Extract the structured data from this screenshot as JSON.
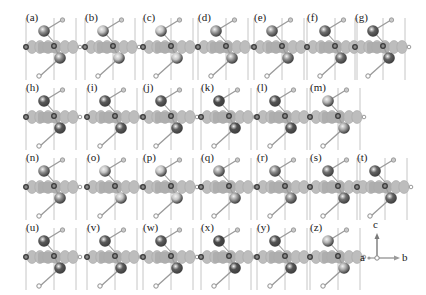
{
  "figure": {
    "colors": {
      "background": "#ffffff",
      "cell_line": "#b8b8b8",
      "slab_blob": "#bdbdbd",
      "slab_blob_edge": "#a6a6a6",
      "slab_center": "#a9a9a9",
      "small_atom_ring": "#3a3a3a",
      "small_atom_fill": "#8a8a8a",
      "ligand_atom": "#c9c9c9",
      "bond": "#9a9a9a",
      "label": "#1a1a1a"
    },
    "panels": [
      {
        "label": "(a)",
        "x": 24,
        "y": 14,
        "top_tone": "#8f8f8f",
        "bottom_tone": "#8f8f8f"
      },
      {
        "label": "(b)",
        "x": 83,
        "y": 14,
        "top_tone": "#c2c2c2",
        "bottom_tone": "#c2c2c2"
      },
      {
        "label": "(c)",
        "x": 141,
        "y": 14,
        "top_tone": "#c6c6c6",
        "bottom_tone": "#c6c6c6"
      },
      {
        "label": "(d)",
        "x": 196,
        "y": 14,
        "top_tone": "#9c9c9c",
        "bottom_tone": "#9c9c9c"
      },
      {
        "label": "(e)",
        "x": 252,
        "y": 14,
        "top_tone": "#8c8c8c",
        "bottom_tone": "#8c8c8c"
      },
      {
        "label": "(f)",
        "x": 305,
        "y": 14,
        "top_tone": "#6f6f6f",
        "bottom_tone": "#6f6f6f"
      },
      {
        "label": "(g)",
        "x": 353,
        "y": 14,
        "top_tone": "#616161",
        "bottom_tone": "#616161"
      },
      {
        "label": "(h)",
        "x": 24,
        "y": 84,
        "top_tone": "#5a5a5a",
        "bottom_tone": "#5a5a5a"
      },
      {
        "label": "(i)",
        "x": 85,
        "y": 84,
        "top_tone": "#5c5c5c",
        "bottom_tone": "#5c5c5c"
      },
      {
        "label": "(j)",
        "x": 141,
        "y": 84,
        "top_tone": "#5e5e5e",
        "bottom_tone": "#5e5e5e"
      },
      {
        "label": "(k)",
        "x": 199,
        "y": 84,
        "top_tone": "#4a4a4a",
        "bottom_tone": "#505050"
      },
      {
        "label": "(l)",
        "x": 255,
        "y": 84,
        "top_tone": "#555555",
        "bottom_tone": "#555555"
      },
      {
        "label": "(m)",
        "x": 308,
        "y": 84,
        "top_tone": "#b5b5b5",
        "bottom_tone": "#a9a9a9"
      },
      {
        "label": "(n)",
        "x": 24,
        "y": 154,
        "top_tone": "#8f8f8f",
        "bottom_tone": "#8f8f8f"
      },
      {
        "label": "(o)",
        "x": 85,
        "y": 154,
        "top_tone": "#c3c3c3",
        "bottom_tone": "#c3c3c3"
      },
      {
        "label": "(p)",
        "x": 141,
        "y": 154,
        "top_tone": "#c6c6c6",
        "bottom_tone": "#c6c6c6"
      },
      {
        "label": "(q)",
        "x": 199,
        "y": 154,
        "top_tone": "#a0a0a0",
        "bottom_tone": "#a0a0a0"
      },
      {
        "label": "(r)",
        "x": 255,
        "y": 154,
        "top_tone": "#8a8a8a",
        "bottom_tone": "#8a8a8a"
      },
      {
        "label": "(s)",
        "x": 308,
        "y": 154,
        "top_tone": "#717171",
        "bottom_tone": "#717171"
      },
      {
        "label": "(t)",
        "x": 355,
        "y": 154,
        "top_tone": "#636363",
        "bottom_tone": "#636363"
      },
      {
        "label": "(u)",
        "x": 24,
        "y": 224,
        "top_tone": "#5a5a5a",
        "bottom_tone": "#5a5a5a"
      },
      {
        "label": "(v)",
        "x": 85,
        "y": 224,
        "top_tone": "#5c5c5c",
        "bottom_tone": "#5c5c5c"
      },
      {
        "label": "(w)",
        "x": 141,
        "y": 224,
        "top_tone": "#5e5e5e",
        "bottom_tone": "#5e5e5e"
      },
      {
        "label": "(x)",
        "x": 199,
        "y": 224,
        "top_tone": "#484848",
        "bottom_tone": "#505050"
      },
      {
        "label": "(y)",
        "x": 255,
        "y": 224,
        "top_tone": "#555555",
        "bottom_tone": "#555555"
      },
      {
        "label": "(z)",
        "x": 308,
        "y": 224,
        "top_tone": "#b5b5b5",
        "bottom_tone": "#a9a9a9"
      }
    ],
    "axes": {
      "up_label": "c",
      "left_label": "a",
      "right_label": "b"
    }
  }
}
